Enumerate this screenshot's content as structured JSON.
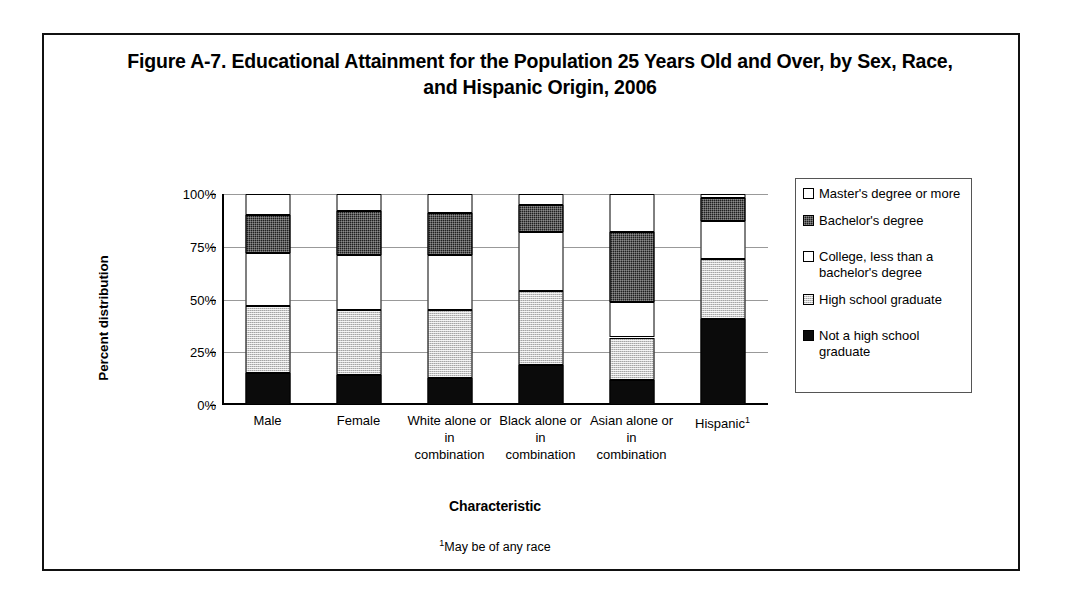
{
  "figure": {
    "title": "Figure A-7. Educational Attainment for the Population 25 Years Old and Over, by Sex, Race, and Hispanic Origin, 2006",
    "footnote": "May be of any race",
    "footnote_marker": "1"
  },
  "chart_data": {
    "type": "bar",
    "stacked": true,
    "title": "Figure A-7. Educational Attainment for the Population 25 Years Old and Over, by Sex, Race, and Hispanic Origin, 2006",
    "xlabel": "Characteristic",
    "ylabel": "Percent distribution",
    "ylim": [
      0,
      100
    ],
    "yticks": [
      "0%",
      "25%",
      "50%",
      "75%",
      "100%"
    ],
    "ytick_values": [
      0,
      25,
      50,
      75,
      100
    ],
    "grid": true,
    "legend_position": "right",
    "categories": [
      "Male",
      "Female",
      "White alone or in combination",
      "Black alone or in combination",
      "Asian alone or in combination",
      "Hispanic"
    ],
    "category_labels": [
      {
        "line1": "Male",
        "line2": "",
        "marker": ""
      },
      {
        "line1": "Female",
        "line2": "",
        "marker": ""
      },
      {
        "line1": "White alone or in",
        "line2": "combination",
        "marker": ""
      },
      {
        "line1": "Black alone or in",
        "line2": "combination",
        "marker": ""
      },
      {
        "line1": "Asian alone or in",
        "line2": "combination",
        "marker": ""
      },
      {
        "line1": "Hispanic",
        "line2": "",
        "marker": "1"
      }
    ],
    "series": [
      {
        "name": "Not a high school graduate",
        "fill": "black",
        "values": [
          15,
          14,
          13,
          19,
          12,
          41
        ]
      },
      {
        "name": "High school graduate",
        "fill": "gray",
        "values": [
          32,
          31,
          32,
          35,
          20,
          28
        ]
      },
      {
        "name": "College, less than a bachelor's degree",
        "fill": "white",
        "values": [
          25,
          26,
          26,
          28,
          17,
          18
        ]
      },
      {
        "name": "Bachelor's degree",
        "fill": "dark",
        "values": [
          18,
          21,
          20,
          13,
          33,
          11
        ]
      },
      {
        "name": "Master's degree or more",
        "fill": "white",
        "values": [
          10,
          8,
          9,
          5,
          18,
          2
        ]
      }
    ],
    "segment_tops": [
      [
        15,
        47,
        72,
        90,
        100
      ],
      [
        14,
        45,
        71,
        92,
        100
      ],
      [
        13,
        45,
        71,
        91,
        100
      ],
      [
        19,
        54,
        82,
        95,
        100
      ],
      [
        12,
        32,
        49,
        82,
        100
      ],
      [
        41,
        69,
        87,
        98,
        100
      ]
    ]
  },
  "legend": {
    "items": [
      {
        "label": "Master's degree or more",
        "fill": "white",
        "swatch": "legend-swatch-white"
      },
      {
        "label": "Bachelor's degree",
        "fill": "dark",
        "swatch": "legend-swatch-dark"
      },
      {
        "label": "College, less than a bachelor's degree",
        "fill": "white",
        "swatch": "legend-swatch-white"
      },
      {
        "label": "High school graduate",
        "fill": "gray",
        "swatch": "legend-swatch-gray"
      },
      {
        "label": "Not a high school graduate",
        "fill": "black",
        "swatch": "legend-swatch-black"
      }
    ]
  },
  "colors": {
    "black": "#0b0b0b",
    "dark": "#1f1f1f",
    "gray": "#c9c9c9",
    "white": "#ffffff",
    "grid": "#999999",
    "axis": "#000000",
    "frame": "#111111"
  }
}
